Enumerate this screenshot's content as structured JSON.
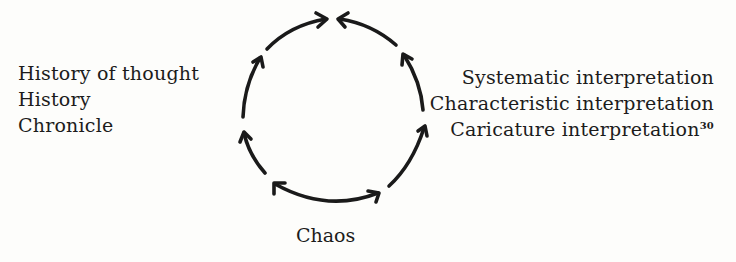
{
  "diagram": {
    "type": "cycle",
    "left_labels": [
      "History of thought",
      "History",
      "Chronicle"
    ],
    "right_labels": [
      "Systematic interpretation",
      "Characteristic interpretation",
      "Caricature interpretation"
    ],
    "right_footnote": "30",
    "bottom_label": "Chaos",
    "arrows": [
      {
        "from": "upper-left",
        "to": "top",
        "direction": "up-right"
      },
      {
        "from": "upper-right",
        "to": "top",
        "direction": "up-left"
      },
      {
        "from": "left-middle",
        "to": "upper-left",
        "direction": "up"
      },
      {
        "from": "right-middle",
        "to": "upper-right",
        "direction": "up"
      },
      {
        "from": "lower-left",
        "to": "left-middle",
        "direction": "up"
      },
      {
        "from": "lower-right",
        "to": "right-middle",
        "direction": "up"
      },
      {
        "from": "bottom",
        "to": "lower-left-and-lower-right",
        "direction": "bidirectional"
      }
    ],
    "stroke_color": "#1a1a1a",
    "background_color": "#fdfdfb"
  }
}
